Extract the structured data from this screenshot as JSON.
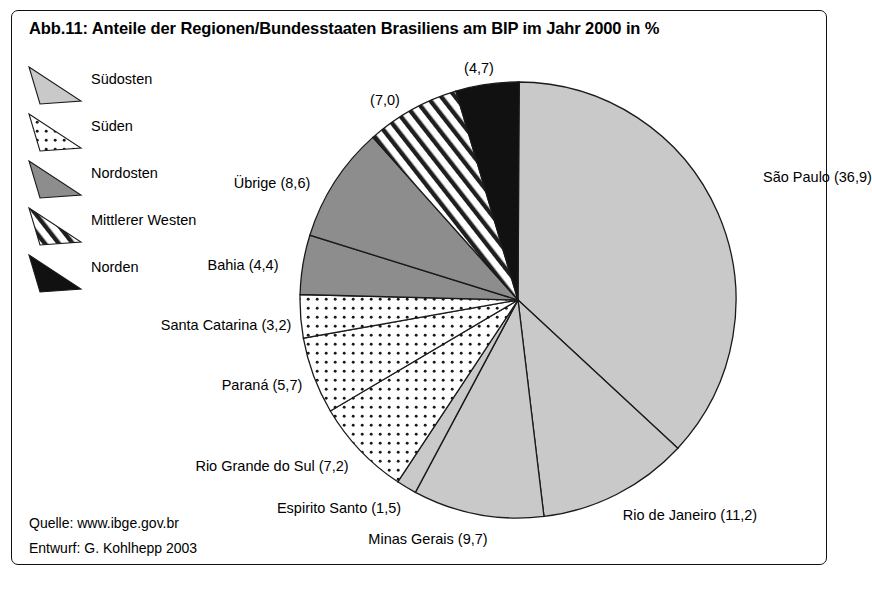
{
  "figure": {
    "title": "Abb.11: Anteile der Regionen/Bundesstaaten Brasiliens am BIP im Jahr 2000 in %",
    "source": "Quelle: www.ibge.gov.br",
    "author": "Entwurf: G. Kohlhepp 2003",
    "frame_color": "#111111",
    "background": "#ffffff"
  },
  "legend": {
    "items": [
      {
        "label": "Südosten",
        "pattern": "solid-light",
        "color": "#c9c9c9"
      },
      {
        "label": "Süden",
        "pattern": "dotted",
        "color": "#ffffff"
      },
      {
        "label": "Nordosten",
        "pattern": "solid-mid",
        "color": "#8d8d8d"
      },
      {
        "label": "Mittlerer Westen",
        "pattern": "hatched",
        "color": "#ffffff"
      },
      {
        "label": "Norden",
        "pattern": "solid-black",
        "color": "#111111"
      }
    ]
  },
  "chart_data": {
    "type": "pie",
    "title": "Abb.11: Anteile der Regionen/Bundesstaaten Brasiliens am BIP im Jahr 2000 in %",
    "unit": "%",
    "total": 100.0,
    "start_angle_deg": 0,
    "direction": "clockwise",
    "legend_position": "left",
    "decimal_separator": ",",
    "center": {
      "x": 518,
      "y": 300
    },
    "radius": 218,
    "slices": [
      {
        "name": "São Paulo",
        "value": 36.9,
        "label": "São Paulo (36,9)",
        "region": "Südosten",
        "pattern": "solid-light",
        "color": "#c9c9c9",
        "label_x": 763,
        "label_y": 177,
        "label_anchor": "start"
      },
      {
        "name": "Rio de Janeiro",
        "value": 11.2,
        "label": "Rio de Janeiro (11,2)",
        "region": "Südosten",
        "pattern": "solid-light",
        "color": "#c9c9c9",
        "label_x": 690,
        "label_y": 515,
        "label_anchor": "middle"
      },
      {
        "name": "Minas Gerais",
        "value": 9.7,
        "label": "Minas Gerais (9,7)",
        "region": "Südosten",
        "pattern": "solid-light",
        "color": "#c9c9c9",
        "label_x": 428,
        "label_y": 539,
        "label_anchor": "middle"
      },
      {
        "name": "Espirito Santo",
        "value": 1.5,
        "label": "Espirito Santo (1,5)",
        "region": "Südosten",
        "pattern": "solid-light",
        "color": "#c9c9c9",
        "label_x": 339,
        "label_y": 508,
        "label_anchor": "middle"
      },
      {
        "name": "Rio Grande do Sul",
        "value": 7.2,
        "label": "Rio Grande do Sul (7,2)",
        "region": "Süden",
        "pattern": "dotted",
        "color": "#ffffff",
        "label_x": 272,
        "label_y": 466,
        "label_anchor": "middle"
      },
      {
        "name": "Paraná",
        "value": 5.7,
        "label": "Paraná (5,7)",
        "region": "Süden",
        "pattern": "dotted",
        "color": "#ffffff",
        "label_x": 262,
        "label_y": 385,
        "label_anchor": "middle"
      },
      {
        "name": "Santa Catarina",
        "value": 3.2,
        "label": "Santa Catarina (3,2)",
        "region": "Süden",
        "pattern": "dotted",
        "color": "#ffffff",
        "label_x": 226,
        "label_y": 325,
        "label_anchor": "middle"
      },
      {
        "name": "Bahia",
        "value": 4.4,
        "label": "Bahia (4,4)",
        "region": "Nordosten",
        "pattern": "solid-mid",
        "color": "#8d8d8d",
        "label_x": 243,
        "label_y": 265,
        "label_anchor": "middle"
      },
      {
        "name": "Übrige",
        "value": 8.6,
        "label": "Übrige (8,6)",
        "region": "Nordosten",
        "pattern": "solid-mid",
        "color": "#8d8d8d",
        "label_x": 272,
        "label_y": 183,
        "label_anchor": "middle"
      },
      {
        "name": "Mittlerer Westen",
        "value": 7.0,
        "label": "(7,0)",
        "region": "Mittlerer Westen",
        "pattern": "hatched",
        "color": "#ffffff",
        "label_x": 385,
        "label_y": 100,
        "label_anchor": "middle"
      },
      {
        "name": "Norden",
        "value": 4.7,
        "label": "(4,7)",
        "region": "Norden",
        "pattern": "solid-black",
        "color": "#111111",
        "label_x": 479,
        "label_y": 68,
        "label_anchor": "middle"
      }
    ],
    "regions": [
      {
        "name": "Südosten",
        "value": 59.3
      },
      {
        "name": "Süden",
        "value": 16.1
      },
      {
        "name": "Nordosten",
        "value": 13.0
      },
      {
        "name": "Mittlerer Westen",
        "value": 7.0
      },
      {
        "name": "Norden",
        "value": 4.7
      }
    ]
  }
}
